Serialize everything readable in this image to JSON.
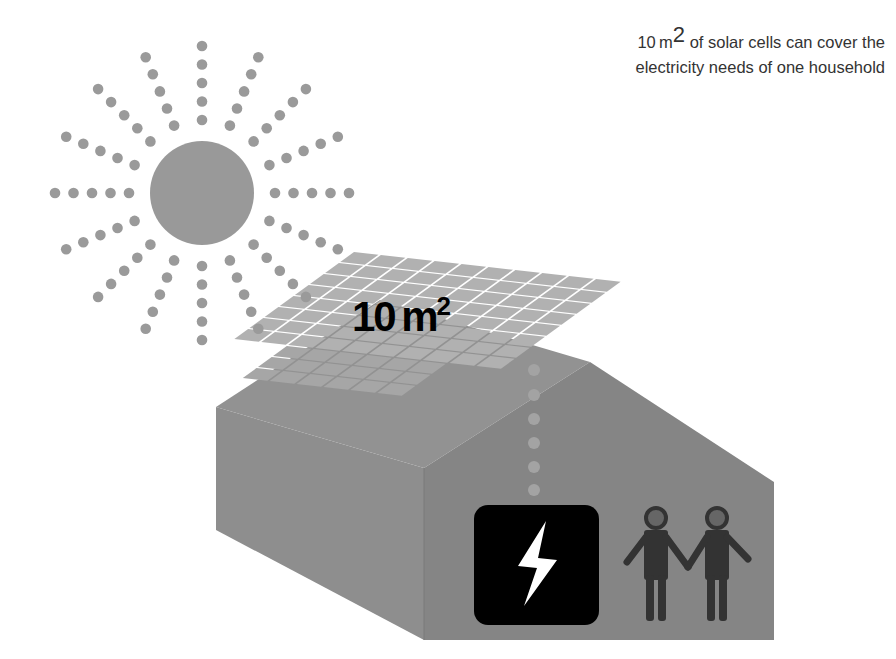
{
  "caption": {
    "prefix": "10 m",
    "superscript": "2",
    "line1_rest": " of solar cells can cover the",
    "line2": "electricity needs of one household"
  },
  "panel_label": {
    "value": "10 m",
    "superscript": "2"
  },
  "icons": {
    "sun": "sun-icon",
    "solar_panel": "solar-panel-icon",
    "house": "house-icon",
    "electricity": "lightning-bolt-icon",
    "people": "two-people-holding-hands-icon"
  },
  "colors": {
    "background": "#ffffff",
    "sun": "#999999",
    "ray_dot": "#9a9a9a",
    "panel_cell": "#b0b0b0",
    "panel_grid": "#ffffff",
    "house_left": "#8c8c8c",
    "house_front": "#858585",
    "roof": "#939393",
    "box": "#000000",
    "bolt": "#ffffff",
    "people": "#333333",
    "caption_text": "#333333"
  }
}
